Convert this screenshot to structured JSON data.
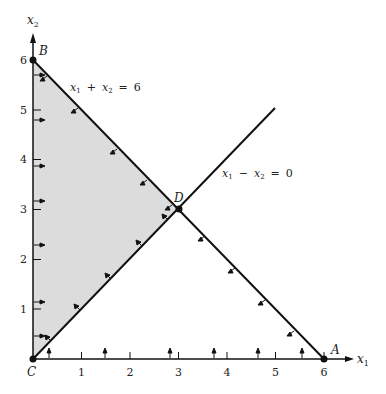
{
  "figure": {
    "type": "linear-programming feasible region",
    "axes": {
      "x_label": "x",
      "x_sub": "1",
      "y_label": "x",
      "y_sub": "2",
      "x_ticks": [
        "1",
        "2",
        "3",
        "4",
        "5",
        "6"
      ],
      "y_ticks": [
        "1",
        "2",
        "3",
        "4",
        "5",
        "6"
      ],
      "range": [
        0,
        6
      ]
    },
    "lines": [
      {
        "name": "constraint-sum",
        "eq_parts": [
          "x",
          "1",
          "+",
          "x",
          "2",
          "=",
          "6"
        ],
        "from": [
          0,
          6
        ],
        "to": [
          6,
          0
        ]
      },
      {
        "name": "constraint-diff",
        "eq_parts": [
          "x",
          "1",
          "−",
          "x",
          "2",
          "=",
          "0"
        ],
        "from": [
          0,
          0
        ],
        "to": [
          5,
          5
        ]
      }
    ],
    "points": [
      {
        "label": "A",
        "x": 6,
        "y": 0
      },
      {
        "label": "B",
        "x": 0,
        "y": 6
      },
      {
        "label": "C",
        "x": 0,
        "y": 0
      },
      {
        "label": "D",
        "x": 3,
        "y": 3
      }
    ],
    "shaded_region": [
      [
        0,
        0
      ],
      [
        3,
        3
      ],
      [
        0,
        6
      ]
    ],
    "colors": {
      "shade": "#dcdcdc",
      "ink": "#111111"
    }
  }
}
